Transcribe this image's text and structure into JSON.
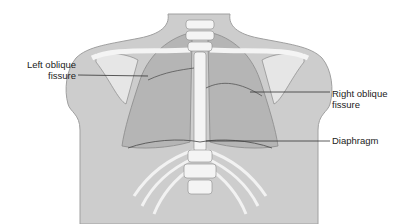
{
  "figure": {
    "labels": [
      {
        "id": "left-oblique-fissure",
        "lines": [
          "Left oblique",
          "fissure"
        ]
      },
      {
        "id": "right-oblique-fissure",
        "lines": [
          "Right oblique",
          "fissure"
        ]
      },
      {
        "id": "diaphragm",
        "lines": [
          "Diaphragm"
        ]
      }
    ]
  },
  "colors": {
    "body": "#c9c9c9",
    "body_outline": "#9a9a9a",
    "lung": "#b3b3b3",
    "bone": "#f4f4f4",
    "line": "#333333",
    "text": "#222222"
  }
}
